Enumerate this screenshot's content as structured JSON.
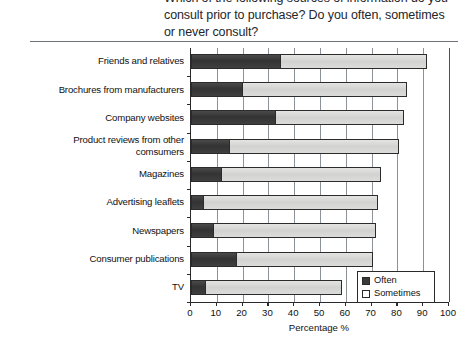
{
  "caption": {
    "cut_line": "Which of the following sources of information do you",
    "line1": "consult prior to purchase? Do you often, sometimes",
    "line2": "or never consult?"
  },
  "legend": {
    "items": [
      {
        "label": "Often",
        "color": "#3a3a3a"
      },
      {
        "label": "Sometimes",
        "color": "#d8d8d6"
      }
    ]
  },
  "axis": {
    "xlabel": "Percentage %",
    "ticks": [
      "0",
      "10",
      "20",
      "30",
      "40",
      "50",
      "60",
      "70",
      "80",
      "90",
      "100"
    ]
  },
  "chart_data": {
    "type": "bar",
    "orientation": "horizontal",
    "stacked": true,
    "title": "",
    "subtitle": "",
    "xlabel": "Percentage %",
    "ylabel": "",
    "xlim": [
      0,
      100
    ],
    "ylim": null,
    "grid": "vertical",
    "legend_position": "bottom-right",
    "categories": [
      "Friends and relatives",
      "Brochures from manufacturers",
      "Company websites",
      "Product reviews from other comsumers",
      "Magazines",
      "Advertising leaflets",
      "Newspapers",
      "Consumer publications",
      "TV"
    ],
    "series": [
      {
        "name": "Often",
        "color": "#3a3a3a",
        "values": [
          35,
          20,
          33,
          15,
          12,
          5,
          9,
          18,
          6
        ]
      },
      {
        "name": "Sometimes",
        "color": "#d8d8d6",
        "values": [
          57,
          64,
          50,
          66,
          62,
          68,
          63,
          53,
          53
        ]
      }
    ],
    "totals": [
      92,
      84,
      83,
      81,
      74,
      73,
      72,
      71,
      59
    ]
  },
  "category_label_lines": [
    [
      "Friends and relatives"
    ],
    [
      "Brochures from manufacturers"
    ],
    [
      "Company websites"
    ],
    [
      "Product reviews from other",
      "comsumers"
    ],
    [
      "Magazines"
    ],
    [
      "Advertising leaflets"
    ],
    [
      "Newspapers"
    ],
    [
      "Consumer publications"
    ],
    [
      "TV"
    ]
  ]
}
